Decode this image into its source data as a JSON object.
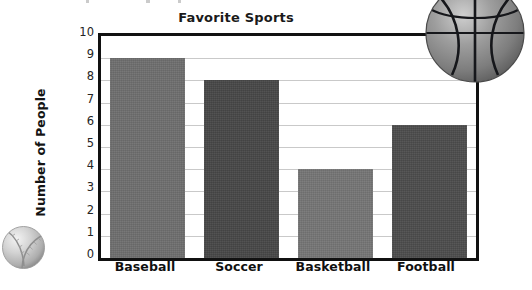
{
  "chart_data": {
    "type": "bar",
    "title": "Favorite Sports",
    "xlabel": "",
    "ylabel": "Number of People",
    "categories": [
      "Baseball",
      "Soccer",
      "Basketball",
      "Football"
    ],
    "values": [
      9,
      8,
      4,
      6
    ],
    "ylim": [
      0,
      10
    ],
    "ytick_labels": [
      "10",
      "9",
      "8",
      "7",
      "6",
      "5",
      "4",
      "3",
      "2",
      "1",
      "0"
    ],
    "ytick_values": [
      10,
      9,
      8,
      7,
      6,
      5,
      4,
      3,
      2,
      1,
      0
    ],
    "grid": true,
    "grid_axis": "y",
    "legend": false,
    "bar_colors": [
      "#6e6e6e",
      "#474747",
      "#757575",
      "#4c4c4c"
    ]
  },
  "decorations": {
    "basketball": {
      "name": "basketball-photo",
      "base_color": "#8a8a8a",
      "seam_color": "#15161a"
    },
    "baseball": {
      "name": "baseball-photo",
      "base_color": "#d6d6d6",
      "seam_color": "#8d8d8d"
    }
  },
  "colors": {
    "axis": "#111111",
    "gridline": "#c9c9c9",
    "text": "#141414",
    "background": "#ffffff"
  }
}
